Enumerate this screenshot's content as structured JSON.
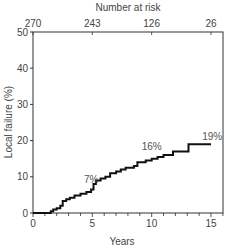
{
  "chart_data": {
    "type": "line",
    "subtype": "step (cumulative incidence)",
    "title": "",
    "xlabel": "Years",
    "ylabel": "Local failure (%)",
    "xlim": [
      0,
      16
    ],
    "ylim": [
      0,
      50
    ],
    "x_ticks": [
      0,
      5,
      10,
      15
    ],
    "y_ticks": [
      0,
      10,
      20,
      30,
      40,
      50
    ],
    "grid": false,
    "top_axis": {
      "label": "Number at risk",
      "ticks": [
        {
          "x": 0,
          "label": "270"
        },
        {
          "x": 5,
          "label": "243"
        },
        {
          "x": 10,
          "label": "126"
        },
        {
          "x": 15,
          "label": "26"
        }
      ]
    },
    "series": [
      {
        "name": "Local failure",
        "color": "#111111",
        "points": [
          [
            0,
            0
          ],
          [
            1.5,
            0
          ],
          [
            1.5,
            0.5
          ],
          [
            1.7,
            0.5
          ],
          [
            1.7,
            1.0
          ],
          [
            2.0,
            1.0
          ],
          [
            2.0,
            1.3
          ],
          [
            2.3,
            1.3
          ],
          [
            2.3,
            2.0
          ],
          [
            2.5,
            2.0
          ],
          [
            2.5,
            3.3
          ],
          [
            2.8,
            3.3
          ],
          [
            2.8,
            3.8
          ],
          [
            3.1,
            3.8
          ],
          [
            3.1,
            4.2
          ],
          [
            3.5,
            4.2
          ],
          [
            3.5,
            4.8
          ],
          [
            4.0,
            4.8
          ],
          [
            4.0,
            5.3
          ],
          [
            4.5,
            5.3
          ],
          [
            4.5,
            5.8
          ],
          [
            4.9,
            5.8
          ],
          [
            4.9,
            6.5
          ],
          [
            5.1,
            6.5
          ],
          [
            5.1,
            8.0
          ],
          [
            5.3,
            8.0
          ],
          [
            5.3,
            9.0
          ],
          [
            5.7,
            9.0
          ],
          [
            5.7,
            9.5
          ],
          [
            6.1,
            9.5
          ],
          [
            6.1,
            10.0
          ],
          [
            6.5,
            10.0
          ],
          [
            6.5,
            11.0
          ],
          [
            7.0,
            11.0
          ],
          [
            7.0,
            11.5
          ],
          [
            7.4,
            11.5
          ],
          [
            7.4,
            12.0
          ],
          [
            7.8,
            12.0
          ],
          [
            7.8,
            12.5
          ],
          [
            8.5,
            12.5
          ],
          [
            8.5,
            13.0
          ],
          [
            8.8,
            13.0
          ],
          [
            8.8,
            14.0
          ],
          [
            9.5,
            14.0
          ],
          [
            9.5,
            14.5
          ],
          [
            10.0,
            14.5
          ],
          [
            10.0,
            15.0
          ],
          [
            10.5,
            15.0
          ],
          [
            10.5,
            15.5
          ],
          [
            11.0,
            15.5
          ],
          [
            11.0,
            16.0
          ],
          [
            11.8,
            16.0
          ],
          [
            11.8,
            17.0
          ],
          [
            13.1,
            17.0
          ],
          [
            13.1,
            19.0
          ],
          [
            15.0,
            19.0
          ]
        ]
      }
    ],
    "annotations": [
      {
        "text": "7%",
        "x": 4.9,
        "y": 8.3
      },
      {
        "text": "16%",
        "x": 10.0,
        "y": 17.3
      },
      {
        "text": "19%",
        "x": 15.1,
        "y": 20.3
      }
    ]
  }
}
